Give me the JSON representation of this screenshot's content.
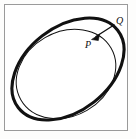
{
  "figure": {
    "background_color": "#ffffff",
    "frame": {
      "name": "figure-border",
      "color": "#9a9a9a",
      "x": 4,
      "y": 4,
      "width": 124,
      "height": 127
    },
    "labels": {
      "P": "P",
      "Q": "Q"
    },
    "stroke_color": "#111111"
  },
  "chart_data": {
    "type": "scatter",
    "xlabel": "",
    "ylabel": "",
    "xlim": [
      4,
      128
    ],
    "ylim": [
      4,
      131
    ],
    "grid": false,
    "legend": "none",
    "shapes": [
      {
        "name": "outer-ellipse",
        "kind": "ellipse",
        "cx": 68,
        "cy": 69,
        "rx": 63,
        "ry": 42,
        "rotation_deg": -38,
        "stroke": "#111111",
        "stroke_width": 3.1,
        "fill": "none"
      },
      {
        "name": "inner-ellipse",
        "kind": "ellipse",
        "cx": 66,
        "cy": 74,
        "rx": 52,
        "ry": 42,
        "rotation_deg": -30,
        "stroke": "#111111",
        "stroke_width": 1.0,
        "fill": "none"
      }
    ],
    "annotations": [
      {
        "name": "arrow-q-to-p",
        "kind": "arrow",
        "from": [
          114,
          25
        ],
        "to": [
          92,
          39
        ],
        "stroke": "#111111",
        "stroke_width": 1.3,
        "head": "triangle"
      },
      {
        "name": "point-label-Q",
        "kind": "text",
        "text": "Q",
        "x": 118,
        "y": 23,
        "italic": true
      },
      {
        "name": "point-label-P",
        "kind": "text",
        "text": "P",
        "x": 87,
        "y": 47,
        "italic": true
      }
    ]
  }
}
